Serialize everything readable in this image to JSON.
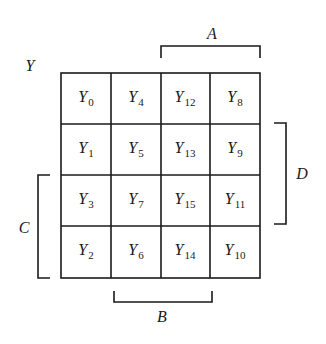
{
  "map": {
    "title": "Y",
    "cells": [
      [
        {
          "base": "Y",
          "sub": "0"
        },
        {
          "base": "Y",
          "sub": "4"
        },
        {
          "base": "Y",
          "sub": "12"
        },
        {
          "base": "Y",
          "sub": "8"
        }
      ],
      [
        {
          "base": "Y",
          "sub": "1"
        },
        {
          "base": "Y",
          "sub": "5"
        },
        {
          "base": "Y",
          "sub": "13"
        },
        {
          "base": "Y",
          "sub": "9"
        }
      ],
      [
        {
          "base": "Y",
          "sub": "3"
        },
        {
          "base": "Y",
          "sub": "7"
        },
        {
          "base": "Y",
          "sub": "15"
        },
        {
          "base": "Y",
          "sub": "11"
        }
      ],
      [
        {
          "base": "Y",
          "sub": "2"
        },
        {
          "base": "Y",
          "sub": "6"
        },
        {
          "base": "Y",
          "sub": "14"
        },
        {
          "base": "Y",
          "sub": "10"
        }
      ]
    ],
    "brackets": {
      "A": "A",
      "B": "B",
      "C": "C",
      "D": "D"
    }
  }
}
